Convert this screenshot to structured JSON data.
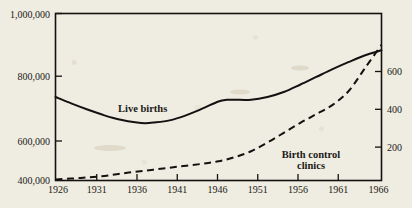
{
  "chart_data": {
    "type": "line",
    "title": "",
    "subtitle": "",
    "xlabel": "",
    "ylabel": "",
    "grid": false,
    "legend_position": "inline-annotation",
    "x": [
      1926,
      1931,
      1936,
      1941,
      1946,
      1951,
      1956,
      1961,
      1966
    ],
    "xlim": [
      1926,
      1966
    ],
    "xtick_labels": [
      "1926",
      "1931",
      "1936",
      "1941",
      "1946",
      "1951",
      "1956",
      "1961",
      "1966"
    ],
    "left_axis": {
      "label": "",
      "ylim": [
        400000,
        1000000
      ],
      "ticks": [
        400000,
        600000,
        800000,
        1000000
      ],
      "tick_labels": [
        "400,000",
        "600,000",
        "800,000",
        "1,000,000"
      ]
    },
    "right_axis": {
      "label": "",
      "ylim": [
        0,
        800
      ],
      "ticks": [
        200,
        400,
        600
      ],
      "tick_labels": [
        "200",
        "400",
        "600"
      ]
    },
    "series": [
      {
        "name": "Live births",
        "axis": "left",
        "style": "solid",
        "annotation": "Live births",
        "x": [
          1926,
          1928,
          1930,
          1932,
          1934,
          1936,
          1937,
          1938,
          1940,
          1942,
          1944,
          1946,
          1947,
          1948,
          1950,
          1952,
          1954,
          1956,
          1958,
          1960,
          1962,
          1964,
          1966
        ],
        "values": [
          700000,
          676000,
          654000,
          634000,
          618000,
          608000,
          606000,
          608000,
          616000,
          634000,
          658000,
          684000,
          690000,
          690000,
          690000,
          700000,
          718000,
          744000,
          772000,
          800000,
          826000,
          850000,
          868000
        ]
      },
      {
        "name": "Birth control clinics",
        "axis": "right",
        "style": "dashed",
        "annotation_line1": "Birth control",
        "annotation_line2": "clinics",
        "x": [
          1926,
          1929,
          1932,
          1935,
          1938,
          1941,
          1944,
          1946,
          1948,
          1950,
          1952,
          1954,
          1956,
          1958,
          1960,
          1962,
          1964,
          1966
        ],
        "values": [
          5,
          12,
          22,
          38,
          52,
          66,
          80,
          92,
          112,
          140,
          182,
          228,
          275,
          318,
          362,
          430,
          540,
          650
        ]
      }
    ]
  },
  "colors": {
    "paper": "#efece1",
    "ink": "#141312"
  }
}
